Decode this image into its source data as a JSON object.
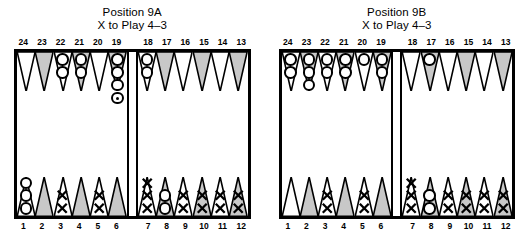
{
  "boards": [
    {
      "title_line1": "Position 9A",
      "title_line2": "X to Play 4–3",
      "top_labels_left": [
        "24",
        "23",
        "22",
        "21",
        "20",
        "19"
      ],
      "top_labels_right": [
        "18",
        "17",
        "16",
        "15",
        "14",
        "13"
      ],
      "bottom_labels_left": [
        "1",
        "2",
        "3",
        "4",
        "5",
        "6"
      ],
      "bottom_labels_right": [
        "7",
        "8",
        "9",
        "10",
        "11",
        "12"
      ],
      "top_points": [
        {
          "point": "24",
          "checker": "none",
          "count": 0,
          "marked": false
        },
        {
          "point": "23",
          "checker": "none",
          "count": 0,
          "marked": false
        },
        {
          "point": "22",
          "checker": "O",
          "count": 2,
          "marked": false
        },
        {
          "point": "21",
          "checker": "O",
          "count": 2,
          "marked": false
        },
        {
          "point": "20",
          "checker": "none",
          "count": 0,
          "marked": false
        },
        {
          "point": "19",
          "checker": "O",
          "count": 4,
          "marked": true
        },
        {
          "point": "18",
          "checker": "O",
          "count": 2,
          "marked": false
        },
        {
          "point": "17",
          "checker": "none",
          "count": 0,
          "marked": false
        },
        {
          "point": "16",
          "checker": "none",
          "count": 0,
          "marked": false
        },
        {
          "point": "15",
          "checker": "none",
          "count": 0,
          "marked": false
        },
        {
          "point": "14",
          "checker": "none",
          "count": 0,
          "marked": false
        },
        {
          "point": "13",
          "checker": "none",
          "count": 0,
          "marked": false
        }
      ],
      "bottom_points": [
        {
          "point": "1",
          "checker": "X",
          "count": 2,
          "marked": false
        },
        {
          "point": "2",
          "checker": "X",
          "count": 2,
          "marked": false
        },
        {
          "point": "3",
          "checker": "X",
          "count": 2,
          "marked": false
        },
        {
          "point": "4",
          "checker": "X",
          "count": 2,
          "marked": false
        },
        {
          "point": "5",
          "checker": "O",
          "count": 2,
          "marked": false
        },
        {
          "point": "6",
          "checker": "X",
          "count": 3,
          "marked": false
        },
        {
          "point": "7",
          "checker": "none",
          "count": 0,
          "marked": false
        },
        {
          "point": "8",
          "checker": "X",
          "count": 2,
          "marked": false
        },
        {
          "point": "9",
          "checker": "none",
          "count": 0,
          "marked": false
        },
        {
          "point": "10",
          "checker": "X",
          "count": 2,
          "marked": false
        },
        {
          "point": "11",
          "checker": "none",
          "count": 0,
          "marked": false
        },
        {
          "point": "12",
          "checker": "O",
          "count": 3,
          "marked": false
        }
      ]
    },
    {
      "title_line1": "Position 9B",
      "title_line2": "X to Play 4–3",
      "top_labels_left": [
        "24",
        "23",
        "22",
        "21",
        "20",
        "19"
      ],
      "top_labels_right": [
        "18",
        "17",
        "16",
        "15",
        "14",
        "13"
      ],
      "bottom_labels_left": [
        "1",
        "2",
        "3",
        "4",
        "5",
        "6"
      ],
      "bottom_labels_right": [
        "7",
        "8",
        "9",
        "10",
        "11",
        "12"
      ],
      "top_points": [
        {
          "point": "24",
          "checker": "O",
          "count": 2,
          "marked": false
        },
        {
          "point": "23",
          "checker": "O",
          "count": 3,
          "marked": false
        },
        {
          "point": "22",
          "checker": "O",
          "count": 2,
          "marked": false
        },
        {
          "point": "21",
          "checker": "O",
          "count": 2,
          "marked": false
        },
        {
          "point": "20",
          "checker": "O",
          "count": 1,
          "marked": false
        },
        {
          "point": "19",
          "checker": "O",
          "count": 2,
          "marked": false
        },
        {
          "point": "18",
          "checker": "none",
          "count": 0,
          "marked": false
        },
        {
          "point": "17",
          "checker": "O",
          "count": 1,
          "marked": false
        },
        {
          "point": "16",
          "checker": "none",
          "count": 0,
          "marked": false
        },
        {
          "point": "15",
          "checker": "none",
          "count": 0,
          "marked": false
        },
        {
          "point": "14",
          "checker": "none",
          "count": 0,
          "marked": false
        },
        {
          "point": "13",
          "checker": "none",
          "count": 0,
          "marked": false
        }
      ],
      "bottom_points": [
        {
          "point": "1",
          "checker": "X",
          "count": 2,
          "marked": false
        },
        {
          "point": "2",
          "checker": "X",
          "count": 2,
          "marked": false
        },
        {
          "point": "3",
          "checker": "X",
          "count": 2,
          "marked": false
        },
        {
          "point": "4",
          "checker": "X",
          "count": 2,
          "marked": false
        },
        {
          "point": "5",
          "checker": "O",
          "count": 2,
          "marked": false
        },
        {
          "point": "6",
          "checker": "X",
          "count": 3,
          "marked": false
        },
        {
          "point": "7",
          "checker": "none",
          "count": 0,
          "marked": false
        },
        {
          "point": "8",
          "checker": "X",
          "count": 2,
          "marked": false
        },
        {
          "point": "9",
          "checker": "none",
          "count": 0,
          "marked": false
        },
        {
          "point": "10",
          "checker": "X",
          "count": 2,
          "marked": false
        },
        {
          "point": "11",
          "checker": "none",
          "count": 0,
          "marked": false
        },
        {
          "point": "12",
          "checker": "none",
          "count": 0,
          "marked": false
        }
      ]
    }
  ],
  "colors": {
    "point_shaded": "#c8c8c8",
    "point_light": "#ffffff",
    "outline": "#000000",
    "board_border": "#000000",
    "background": "#ffffff"
  }
}
